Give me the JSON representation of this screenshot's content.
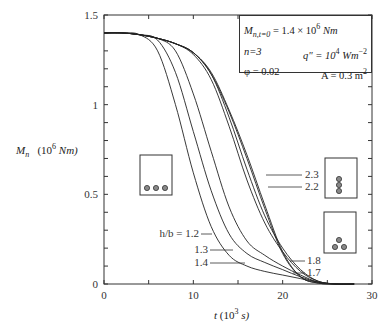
{
  "chart_data": {
    "type": "line",
    "title": "",
    "xlabel": "t (10^3 s)",
    "ylabel": "M_n  (10^6 Nm)",
    "xlim": [
      0,
      30
    ],
    "ylim": [
      0,
      1.5
    ],
    "x_ticks": [
      "0",
      "10",
      "20",
      "30"
    ],
    "y_ticks": [
      "0",
      "0.5",
      "1",
      "1.5"
    ],
    "grid": false,
    "legend_position": "top-right box",
    "annotations": {
      "box_lines": [
        {
          "left": "M_n,t=0 = 1.4 × 10^6 Nm",
          "right": ""
        },
        {
          "left": "n=3",
          "right": "q\" = 10^4 Wm^-2"
        },
        {
          "left": "φ = 0.02",
          "right": "A = 0.3 m^2"
        }
      ],
      "curve_labels": [
        "h/b = 1.2",
        "1.3",
        "1.4",
        "1.7",
        "1.8",
        "2.2",
        "2.3"
      ],
      "insets": [
        "section with 3 bars in a row (h/b small)",
        "section with 3 bars stacked vertically",
        "section with 3 bars in triangle"
      ]
    },
    "x": [
      0,
      2,
      4,
      6,
      8,
      10,
      12,
      14,
      16,
      18,
      20,
      22,
      24,
      26,
      28
    ],
    "series": [
      {
        "name": "h/b = 1.2",
        "values": [
          1.4,
          1.4,
          1.39,
          1.3,
          1.0,
          0.62,
          0.32,
          0.16,
          0.1,
          0.07,
          0.05,
          0.03,
          0.01,
          0.0,
          0.0
        ]
      },
      {
        "name": "h/b = 1.3",
        "values": [
          1.4,
          1.4,
          1.39,
          1.36,
          1.18,
          0.85,
          0.52,
          0.28,
          0.17,
          0.12,
          0.08,
          0.04,
          0.01,
          0.0,
          0.0
        ]
      },
      {
        "name": "h/b = 1.4",
        "values": [
          1.4,
          1.4,
          1.39,
          1.37,
          1.3,
          1.06,
          0.74,
          0.43,
          0.24,
          0.16,
          0.1,
          0.05,
          0.01,
          0.0,
          0.0
        ]
      },
      {
        "name": "h/b = 1.7",
        "values": [
          1.4,
          1.4,
          1.39,
          1.37,
          1.34,
          1.28,
          1.14,
          0.88,
          0.58,
          0.34,
          0.18,
          0.07,
          0.015,
          0.0,
          0.0
        ]
      },
      {
        "name": "h/b = 1.8",
        "values": [
          1.4,
          1.4,
          1.39,
          1.37,
          1.34,
          1.29,
          1.17,
          0.93,
          0.64,
          0.38,
          0.2,
          0.08,
          0.015,
          0.0,
          0.0
        ]
      },
      {
        "name": "h/b = 2.2",
        "values": [
          1.4,
          1.4,
          1.39,
          1.37,
          1.34,
          1.29,
          1.17,
          0.96,
          0.7,
          0.42,
          0.17,
          0.04,
          0.005,
          0.0,
          0.0
        ]
      },
      {
        "name": "h/b = 2.3",
        "values": [
          1.4,
          1.4,
          1.39,
          1.37,
          1.34,
          1.29,
          1.18,
          0.97,
          0.72,
          0.44,
          0.18,
          0.04,
          0.005,
          0.0,
          0.0
        ]
      }
    ]
  },
  "axis": {
    "x_label_t": "t",
    "x_label_unit": "(10",
    "x_label_exp": "3",
    "x_label_end": " s)",
    "y_label_m": "M",
    "y_label_sub": "n",
    "y_label_unit": "(10",
    "y_label_exp": "6",
    "y_label_end": " Nm)"
  },
  "legend": {
    "row1_left": "M",
    "row1_sub": "n,t=0",
    "row1_right": " = 1.4 × 10",
    "row1_exp": "6",
    "row1_unit": " Nm",
    "row2_left": "n=3",
    "row2_right": "q\" = 10",
    "row2_exp": "4",
    "row2_unit": " Wm",
    "row2_unit_exp": "−2",
    "row3_left": "φ = 0.02",
    "row3_right": "A = 0.3 m",
    "row3_exp": "2"
  }
}
